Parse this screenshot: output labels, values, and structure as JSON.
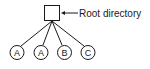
{
  "diagram": {
    "type": "tree",
    "root": {
      "shape": "square",
      "label": "Root directory"
    },
    "children": [
      {
        "label": "A"
      },
      {
        "label": "A"
      },
      {
        "label": "B"
      },
      {
        "label": "C"
      }
    ],
    "colors": {
      "stroke": "#1a1a1a",
      "background": "#ffffff"
    }
  }
}
